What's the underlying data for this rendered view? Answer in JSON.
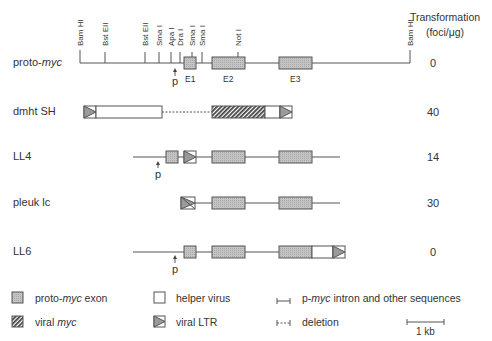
{
  "header": {
    "transformation_line1": "Transformation",
    "transformation_line2": "(foci/μg)"
  },
  "restriction_sites": [
    {
      "label": "Bam HI",
      "x": 80
    },
    {
      "label": "Bst EII",
      "x": 105
    },
    {
      "label": "Bst EII",
      "x": 145
    },
    {
      "label": "Sma I",
      "x": 159
    },
    {
      "label": "Apa I",
      "x": 171
    },
    {
      "label": "Dra I",
      "x": 180
    },
    {
      "label": "Sma I",
      "x": 192
    },
    {
      "label": "Sma I",
      "x": 202
    },
    {
      "label": "Not I",
      "x": 238
    },
    {
      "label": "Bam HI",
      "x": 410
    }
  ],
  "constructs": [
    {
      "name_prefix": "proto-",
      "name_italic": "myc",
      "name": "proto-myc",
      "foci": "0"
    },
    {
      "name_prefix": "dmht SH",
      "name_italic": "",
      "name": "dmht SH",
      "foci": "40"
    },
    {
      "name_prefix": "LL4",
      "name_italic": "",
      "name": "LL4",
      "foci": "14"
    },
    {
      "name_prefix": "pleuk lc",
      "name_italic": "",
      "name": "pleuk lc",
      "foci": "30"
    },
    {
      "name_prefix": "LL6",
      "name_italic": "",
      "name": "LL6",
      "foci": "0"
    }
  ],
  "exon_labels": [
    "E1",
    "E2",
    "E3"
  ],
  "promoter_label": "p",
  "legend": {
    "proto_myc_exon_prefix": "proto-",
    "proto_myc_exon_italic": "myc",
    "proto_myc_exon_suffix": " exon",
    "viral_myc_prefix": "viral ",
    "viral_myc_italic": "myc",
    "helper_virus": "helper virus",
    "viral_ltr": "viral LTR",
    "intron_prefix": "p-",
    "intron_italic": "myc",
    "intron_suffix": " intron and other sequences",
    "deletion": "deletion",
    "scale": "1 kb"
  },
  "colors": {
    "line": "#555555",
    "exon_fill": "#b8b8b8",
    "ltr_fill": "#9a9a9a",
    "text": "#333333"
  }
}
